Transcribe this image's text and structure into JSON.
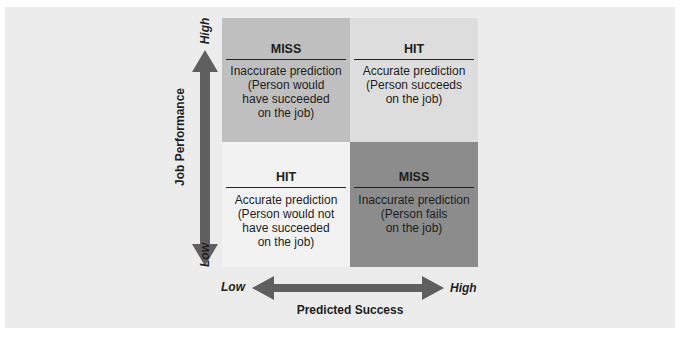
{
  "diagram": {
    "y_axis": {
      "label": "Job Performance",
      "high": "High",
      "low": "Low"
    },
    "x_axis": {
      "label": "Predicted Success",
      "high": "High",
      "low": "Low"
    },
    "quadrants": [
      {
        "position": "top-left",
        "title": "MISS",
        "lines": [
          "Inaccurate prediction",
          "(Person would",
          "have succeeded",
          "on the job)"
        ]
      },
      {
        "position": "top-right",
        "title": "HIT",
        "lines": [
          "Accurate prediction",
          "(Person succeeds",
          "on the job)"
        ]
      },
      {
        "position": "bottom-left",
        "title": "HIT",
        "lines": [
          "Accurate prediction",
          "(Person would not",
          "have succeeded",
          "on the job)"
        ]
      },
      {
        "position": "bottom-right",
        "title": "MISS",
        "lines": [
          "Inaccurate prediction",
          "(Person fails",
          "on the job)"
        ]
      }
    ],
    "colors": {
      "panel": "#ececec",
      "top_left": "#bfbfbf",
      "top_right": "#dddddd",
      "bottom_left": "#f2f2f2",
      "bottom_right": "#8c8c8c",
      "arrow": "#5f5f5f"
    }
  }
}
